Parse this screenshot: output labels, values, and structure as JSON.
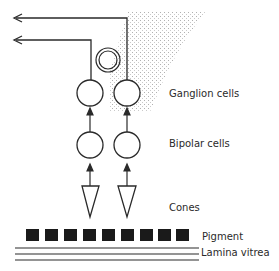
{
  "diagram": {
    "type": "retina-layers-schematic",
    "labels": {
      "ganglion": "Ganglion cells",
      "bipolar": "Bipolar cells",
      "cones": "Cones",
      "pigment": "Pigment",
      "lamina": "Lamina vitrea"
    },
    "pigment_blocks": 9,
    "lamina_lines": 3,
    "colors": {
      "stroke": "#2a2a2a",
      "pigment": "#1a1a1a",
      "stipple": "#9a9a9a"
    }
  }
}
